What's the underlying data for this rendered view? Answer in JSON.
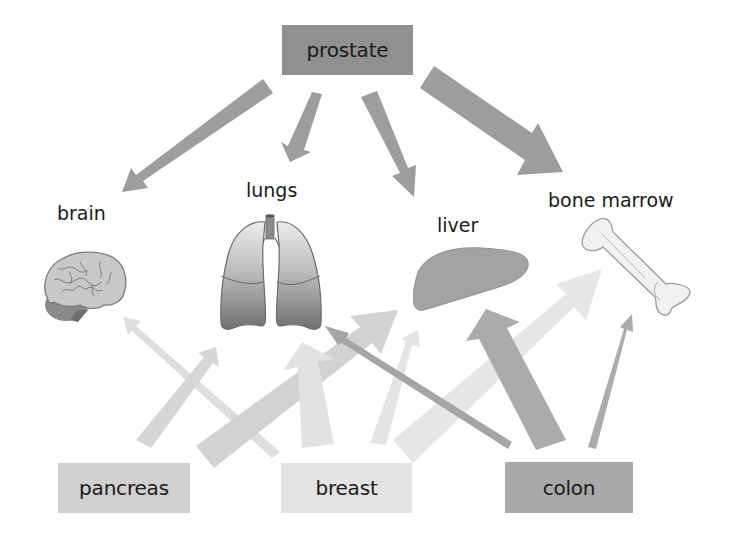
{
  "diagram": {
    "type": "cancer metastasis map",
    "sources": {
      "top": {
        "label": "prostate",
        "color": "#909090"
      },
      "bottom": [
        {
          "label": "pancreas",
          "color": "#d0d0d0"
        },
        {
          "label": "breast",
          "color": "#e3e3e3"
        },
        {
          "label": "colon",
          "color": "#a9a9a9"
        }
      ]
    },
    "organs": [
      {
        "label": "brain"
      },
      {
        "label": "lungs"
      },
      {
        "label": "liver"
      },
      {
        "label": "bone marrow"
      }
    ],
    "arrows": [
      {
        "from": "prostate",
        "to": "brain",
        "weight": "medium"
      },
      {
        "from": "prostate",
        "to": "lungs",
        "weight": "small"
      },
      {
        "from": "prostate",
        "to": "liver",
        "weight": "medium"
      },
      {
        "from": "prostate",
        "to": "bone marrow",
        "weight": "large"
      },
      {
        "from": "pancreas",
        "to": "brain",
        "weight": "small"
      },
      {
        "from": "pancreas",
        "to": "lungs",
        "weight": "medium"
      },
      {
        "from": "pancreas",
        "to": "liver",
        "weight": "large"
      },
      {
        "from": "breast",
        "to": "lungs",
        "weight": "large"
      },
      {
        "from": "breast",
        "to": "liver",
        "weight": "medium"
      },
      {
        "from": "breast",
        "to": "bone marrow",
        "weight": "large"
      },
      {
        "from": "colon",
        "to": "brain",
        "weight": "small"
      },
      {
        "from": "colon",
        "to": "liver",
        "weight": "large"
      },
      {
        "from": "colon",
        "to": "bone marrow",
        "weight": "small"
      }
    ]
  }
}
